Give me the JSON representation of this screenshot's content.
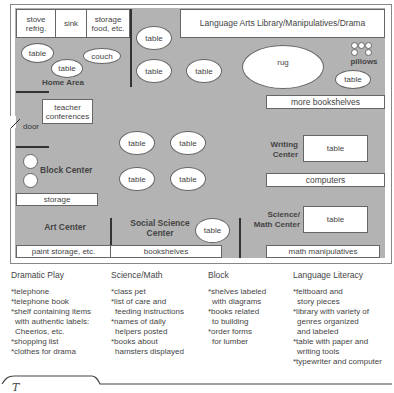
{
  "floor_plan": {
    "top_row": {
      "stove": "stove\nrefrig.",
      "sink": "sink",
      "storage_food": "storage\nfood, etc.",
      "language_arts": "Language Arts Library/Manipulatives/Drama"
    },
    "home_area": {
      "label": "Home Area",
      "table1": "table",
      "table2": "table",
      "couch": "couch"
    },
    "middle_tables": [
      "table",
      "table",
      "table"
    ],
    "rug": "rug",
    "pillows": "pillows",
    "pillow_table": "table",
    "more_bookshelves": "more bookshelves",
    "teacher_conferences": "teacher\nconferences",
    "door": "door",
    "center_tables": [
      "table",
      "table",
      "table",
      "table"
    ],
    "writing_center": {
      "label": "Writing\nCenter",
      "table": "table"
    },
    "computers": "computers",
    "block_center": "Block Center",
    "storage": "storage",
    "science_math": {
      "label": "Science/\nMath Center",
      "table": "table"
    },
    "art_center": "Art Center",
    "social_science": {
      "label": "Social Science\nCenter",
      "table": "table"
    },
    "paint_storage": "paint storage, etc.",
    "bookshelves": "bookshelves",
    "math_manipulatives": "math manipulatives"
  },
  "lists": [
    {
      "title": "Dramatic Play",
      "items": [
        "*telephone",
        "*telephone book",
        "*shelf containing items\nwith authentic labels:\nCheerios, etc.",
        "*shopping list",
        "*clothes for drama"
      ]
    },
    {
      "title": "Science/Math",
      "items": [
        "*class pet",
        "*list of care and\nfeeding instructions",
        "*names of daily\nhelpers posted",
        "*books about\nhamsters displayed"
      ]
    },
    {
      "title": "Block",
      "items": [
        "*shelves labeled\nwith diagrams",
        "*books related\nto building",
        "*order forms\nfor lumber"
      ]
    },
    {
      "title": "Language Literacy",
      "items": [
        "*feltboard and\nstory pieces",
        "*library with variety of\ngenres organized\nand labeled",
        "*table with paper and\nwriting tools",
        "*typewriter and computer"
      ]
    }
  ],
  "footer": {
    "tab_glyph": "T"
  }
}
